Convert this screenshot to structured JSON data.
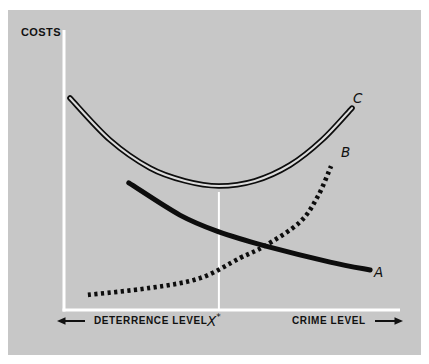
{
  "figure": {
    "y_axis_label": "COSTS",
    "x_axis_left_label": "DETERRENCE LEVEL",
    "x_axis_right_label": "CRIME LEVEL",
    "x_marker": {
      "base": "X",
      "superscript": "*"
    },
    "curve_labels": {
      "a": "A",
      "b": "B",
      "c": "C"
    }
  },
  "colors": {
    "panel_background": "#c7c7c7",
    "axis_lines": "#ffffff",
    "curves_and_text": "#0d0d0d"
  },
  "chart_data": {
    "type": "line",
    "title": "",
    "ylabel": "COSTS",
    "xlabel_left": "DETERRENCE LEVEL",
    "xlabel_right": "CRIME LEVEL",
    "x_axis_numeric_ticks": false,
    "y_axis_numeric_ticks": false,
    "grid": false,
    "legend_position": "curve-end-labels",
    "x_marker_label": "X*",
    "x_marker_position": 46.1,
    "axis_range_note": "axes unlabeled; values estimated on 0-100 scale of plot area",
    "series": [
      {
        "name": "A",
        "line_style": "solid-thick",
        "points": [
          [
            19.3,
            45.4
          ],
          [
            34.5,
            33.9
          ],
          [
            46.1,
            27.9
          ],
          [
            59.8,
            22.9
          ],
          [
            79.2,
            17.1
          ],
          [
            91.1,
            14.3
          ]
        ]
      },
      {
        "name": "B",
        "line_style": "dotted",
        "points": [
          [
            7.1,
            5.4
          ],
          [
            25.6,
            7.9
          ],
          [
            40.5,
            11.4
          ],
          [
            52.4,
            18.6
          ],
          [
            59.8,
            22.9
          ],
          [
            70.2,
            31.4
          ],
          [
            75.6,
            40.7
          ],
          [
            79.5,
            51.4
          ]
        ]
      },
      {
        "name": "C",
        "line_style": "double-line",
        "points": [
          [
            1.8,
            75.7
          ],
          [
            13.7,
            60.7
          ],
          [
            25.6,
            50.7
          ],
          [
            36.0,
            46.1
          ],
          [
            46.1,
            44.3
          ],
          [
            56.8,
            46.1
          ],
          [
            67.3,
            51.8
          ],
          [
            76.8,
            60.7
          ],
          [
            85.7,
            72.1
          ]
        ]
      }
    ]
  }
}
